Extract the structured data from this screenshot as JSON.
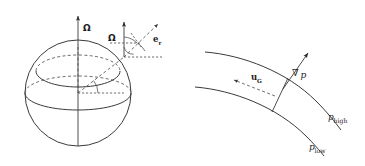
{
  "figure": {
    "background_color": "#ffffff",
    "line_color": "#3a3a3a",
    "text_color": "#1c1c1c",
    "width": 365,
    "height": 166
  },
  "sphere_panel": {
    "name": "rotating-sphere-diagram",
    "labels": {
      "rotation_axis": "Ω",
      "local_rotation": "Ω",
      "radial_unit_vector": "e",
      "radial_unit_subscript": "r"
    },
    "elements": {
      "sphere_outline": "circle",
      "equator": "solid-ellipse",
      "latitude_circle_upper": "dashed-ellipse",
      "latitude_circle_lower": "dashed-ellipse",
      "polar_axis": "vertical-arrow",
      "radius_line": "dashed-line-center-to-surface",
      "latitude_angle_arc": "arc-at-center",
      "local_vertical_arrow": "arrow",
      "local_horizontal_reference": "dashed-line",
      "local_angle_arcs": "arcs"
    }
  },
  "geostrophic_panel": {
    "name": "geostrophic-flow-diagram",
    "labels": {
      "pressure_gradient": "∇",
      "pressure_gradient_var": "p",
      "geostrophic_velocity": "u",
      "geostrophic_velocity_subscript": "G",
      "isobar_high": "p",
      "isobar_high_subscript": "high",
      "isobar_low": "p",
      "isobar_low_subscript": "low"
    },
    "elements": {
      "isobar_upper": "curve",
      "isobar_lower": "curve",
      "gradient_arrow": "solid-arrow-perpendicular-to-isobars",
      "velocity_arrow": "dashed-arrow-along-isobars",
      "perpendicular_connector": "line-segment"
    }
  }
}
